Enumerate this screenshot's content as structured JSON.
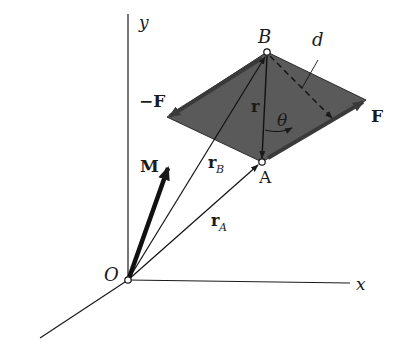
{
  "figure": {
    "type": "3D vector diagram of a couple moment",
    "background": "#ffffff",
    "line_color": "#1a1a1a",
    "plane_fill": "#5a5a5a"
  },
  "axes": {
    "y_label": "y",
    "x_label": "x",
    "origin_label": "O"
  },
  "points": {
    "B_label": "B",
    "A_label": "A"
  },
  "vectors": {
    "M_label": "M",
    "rB_label": "r",
    "rB_sub": "B",
    "rA_label": "r",
    "rA_sub": "A",
    "r_label": "r"
  },
  "forces": {
    "neg_F_label": "−F",
    "F_label": "F"
  },
  "geometry": {
    "d_label": "d",
    "theta_label": "θ"
  }
}
